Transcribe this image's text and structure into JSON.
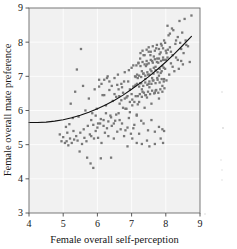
{
  "figure": {
    "background_color": "#ffffff",
    "panel_color": "#f1f1f1",
    "grid_color": "#ffffff",
    "point_color": "#787878",
    "curve_color": "#111111",
    "axis_color": "#6b6b6b"
  },
  "chart_data": {
    "type": "scatter",
    "title": "",
    "xlabel": "Female overall self-perception",
    "ylabel": "Female overall mate preference",
    "xlim": [
      4,
      9
    ],
    "ylim": [
      3,
      9
    ],
    "xticks": [
      4,
      5,
      6,
      7,
      8,
      9
    ],
    "yticks": [
      3,
      4,
      5,
      6,
      7,
      8,
      9
    ],
    "xtick_labels": [
      "4",
      "5",
      "6",
      "7",
      "8",
      "9"
    ],
    "ytick_labels": [
      "3",
      "4",
      "5",
      "6",
      "7",
      "8",
      "9"
    ],
    "grid": true,
    "legend": "none",
    "marker": "square",
    "marker_size_px": 2.3,
    "annotations": [],
    "fit_curve": {
      "label": "quadratic fit",
      "comment": "flat near y=5.65 at low x, rising steeply above x=6.5",
      "x": [
        4.0,
        4.25,
        4.5,
        4.75,
        5.0,
        5.25,
        5.5,
        5.75,
        6.0,
        6.25,
        6.5,
        6.75,
        7.0,
        7.25,
        7.5,
        7.75,
        8.0,
        8.25,
        8.5,
        8.75
      ],
      "y": [
        5.65,
        5.65,
        5.66,
        5.69,
        5.73,
        5.79,
        5.86,
        5.95,
        6.05,
        6.17,
        6.3,
        6.45,
        6.62,
        6.8,
        6.99,
        7.2,
        7.42,
        7.66,
        7.91,
        8.17
      ]
    },
    "points": [
      [
        4.9,
        5.3
      ],
      [
        4.95,
        5.1
      ],
      [
        5.0,
        5.22
      ],
      [
        5.05,
        5.05
      ],
      [
        5.08,
        5.52
      ],
      [
        5.1,
        5.1
      ],
      [
        5.12,
        5.35
      ],
      [
        5.15,
        4.98
      ],
      [
        5.18,
        5.6
      ],
      [
        5.2,
        5.18
      ],
      [
        5.22,
        6.2
      ],
      [
        5.25,
        5.05
      ],
      [
        5.28,
        5.78
      ],
      [
        5.3,
        5.4
      ],
      [
        5.32,
        5.15
      ],
      [
        5.35,
        6.55
      ],
      [
        5.38,
        5.25
      ],
      [
        5.4,
        7.2
      ],
      [
        5.42,
        5.12
      ],
      [
        5.45,
        5.82
      ],
      [
        5.48,
        4.8
      ],
      [
        5.5,
        5.35
      ],
      [
        5.52,
        7.8
      ],
      [
        5.55,
        5.02
      ],
      [
        5.58,
        6.72
      ],
      [
        5.6,
        5.45
      ],
      [
        5.62,
        5.2
      ],
      [
        5.65,
        6.0
      ],
      [
        5.68,
        5.1
      ],
      [
        5.7,
        4.62
      ],
      [
        5.72,
        5.55
      ],
      [
        5.75,
        6.35
      ],
      [
        5.78,
        5.3
      ],
      [
        5.8,
        4.45
      ],
      [
        5.82,
        5.25
      ],
      [
        5.85,
        5.92
      ],
      [
        5.88,
        4.32
      ],
      [
        5.9,
        5.18
      ],
      [
        5.92,
        6.62
      ],
      [
        5.95,
        5.4
      ],
      [
        5.98,
        6.05
      ],
      [
        6.0,
        5.5
      ],
      [
        6.02,
        5.2
      ],
      [
        6.05,
        6.7
      ],
      [
        6.08,
        5.62
      ],
      [
        6.1,
        4.6
      ],
      [
        6.12,
        5.05
      ],
      [
        6.15,
        6.45
      ],
      [
        6.18,
        5.72
      ],
      [
        6.2,
        6.9
      ],
      [
        6.22,
        5.35
      ],
      [
        6.25,
        6.15
      ],
      [
        6.28,
        5.48
      ],
      [
        6.3,
        7.0
      ],
      [
        6.32,
        5.25
      ],
      [
        6.35,
        6.6
      ],
      [
        6.38,
        5.85
      ],
      [
        6.4,
        4.62
      ],
      [
        6.42,
        5.55
      ],
      [
        6.45,
        6.28
      ],
      [
        6.48,
        5.18
      ],
      [
        6.5,
        6.95
      ],
      [
        6.52,
        5.7
      ],
      [
        6.55,
        6.4
      ],
      [
        6.58,
        5.38
      ],
      [
        6.6,
        7.05
      ],
      [
        6.62,
        5.92
      ],
      [
        6.65,
        6.2
      ],
      [
        6.68,
        5.45
      ],
      [
        6.7,
        6.78
      ],
      [
        6.72,
        5.62
      ],
      [
        6.75,
        6.52
      ],
      [
        6.78,
        5.25
      ],
      [
        6.8,
        7.12
      ],
      [
        6.82,
        6.05
      ],
      [
        6.85,
        6.38
      ],
      [
        6.88,
        5.5
      ],
      [
        6.9,
        6.85
      ],
      [
        6.92,
        5.78
      ],
      [
        6.95,
        6.62
      ],
      [
        6.98,
        5.32
      ],
      [
        7.0,
        7.25
      ],
      [
        7.02,
        6.15
      ],
      [
        7.05,
        6.7
      ],
      [
        7.08,
        5.58
      ],
      [
        7.1,
        7.0
      ],
      [
        7.12,
        6.42
      ],
      [
        7.15,
        5.88
      ],
      [
        7.18,
        6.95
      ],
      [
        7.2,
        7.4
      ],
      [
        7.22,
        6.25
      ],
      [
        7.25,
        6.8
      ],
      [
        7.28,
        5.7
      ],
      [
        7.3,
        7.15
      ],
      [
        7.32,
        6.55
      ],
      [
        7.35,
        7.62
      ],
      [
        7.38,
        6.08
      ],
      [
        7.4,
        6.92
      ],
      [
        7.42,
        7.3
      ],
      [
        7.45,
        6.38
      ],
      [
        7.48,
        7.05
      ],
      [
        7.5,
        7.72
      ],
      [
        7.52,
        6.68
      ],
      [
        7.55,
        7.2
      ],
      [
        7.58,
        6.2
      ],
      [
        7.6,
        7.45
      ],
      [
        7.62,
        6.88
      ],
      [
        7.65,
        7.58
      ],
      [
        7.68,
        6.52
      ],
      [
        7.7,
        7.28
      ],
      [
        7.72,
        7.82
      ],
      [
        7.75,
        6.95
      ],
      [
        7.78,
        7.4
      ],
      [
        7.8,
        6.35
      ],
      [
        7.82,
        7.65
      ],
      [
        7.85,
        7.1
      ],
      [
        7.88,
        7.9
      ],
      [
        7.9,
        6.72
      ],
      [
        7.92,
        7.48
      ],
      [
        7.95,
        8.05
      ],
      [
        7.98,
        7.22
      ],
      [
        8.0,
        7.75
      ],
      [
        8.02,
        6.88
      ],
      [
        8.05,
        7.55
      ],
      [
        8.08,
        8.2
      ],
      [
        8.1,
        7.05
      ],
      [
        8.12,
        7.85
      ],
      [
        8.15,
        7.38
      ],
      [
        8.18,
        8.4
      ],
      [
        8.2,
        7.62
      ],
      [
        8.25,
        7.15
      ],
      [
        8.3,
        8.05
      ],
      [
        8.35,
        7.48
      ],
      [
        8.4,
        8.62
      ],
      [
        8.45,
        7.8
      ],
      [
        8.5,
        7.35
      ],
      [
        8.55,
        8.68
      ],
      [
        8.6,
        7.92
      ],
      [
        8.7,
        7.42
      ],
      [
        8.75,
        8.78
      ],
      [
        6.62,
        6.62
      ],
      [
        6.7,
        6.3
      ],
      [
        6.78,
        6.85
      ],
      [
        6.85,
        6.05
      ],
      [
        6.92,
        7.18
      ],
      [
        7.0,
        6.48
      ],
      [
        7.05,
        7.32
      ],
      [
        7.12,
        6.75
      ],
      [
        7.18,
        6.18
      ],
      [
        7.25,
        7.52
      ],
      [
        7.3,
        6.62
      ],
      [
        7.35,
        7.08
      ],
      [
        7.4,
        6.45
      ],
      [
        7.45,
        7.35
      ],
      [
        7.5,
        6.78
      ],
      [
        7.55,
        7.62
      ],
      [
        7.6,
        6.95
      ],
      [
        7.65,
        7.25
      ],
      [
        7.7,
        6.58
      ],
      [
        7.75,
        7.52
      ],
      [
        7.8,
        7.02
      ],
      [
        7.85,
        7.7
      ],
      [
        7.9,
        7.3
      ],
      [
        7.95,
        6.92
      ],
      [
        8.0,
        7.48
      ],
      [
        6.55,
        5.88
      ],
      [
        6.65,
        5.72
      ],
      [
        6.75,
        6.08
      ],
      [
        6.82,
        5.42
      ],
      [
        6.95,
        5.95
      ],
      [
        7.05,
        5.48
      ],
      [
        7.15,
        5.85
      ],
      [
        7.22,
        5.32
      ],
      [
        7.35,
        5.62
      ],
      [
        7.48,
        5.42
      ],
      [
        7.58,
        5.72
      ],
      [
        7.68,
        5.38
      ],
      [
        7.8,
        5.52
      ],
      [
        7.9,
        5.45
      ],
      [
        7.95,
        5.4
      ],
      [
        7.15,
        5.05
      ],
      [
        7.3,
        5.02
      ],
      [
        7.45,
        5.12
      ],
      [
        7.52,
        4.95
      ],
      [
        6.88,
        4.95
      ],
      [
        7.02,
        5.18
      ],
      [
        7.68,
        5.02
      ],
      [
        7.85,
        5.18
      ],
      [
        7.92,
        5.05
      ],
      [
        7.12,
        6.98
      ],
      [
        7.16,
        7.05
      ],
      [
        7.22,
        7.02
      ],
      [
        7.28,
        6.98
      ],
      [
        7.34,
        7.08
      ],
      [
        7.4,
        7.02
      ],
      [
        7.46,
        7.12
      ],
      [
        7.52,
        7.05
      ],
      [
        7.58,
        7.15
      ],
      [
        7.64,
        7.08
      ],
      [
        7.7,
        7.18
      ],
      [
        7.76,
        7.12
      ],
      [
        7.82,
        7.22
      ],
      [
        7.88,
        7.15
      ],
      [
        7.94,
        7.25
      ],
      [
        7.1,
        6.72
      ],
      [
        7.16,
        6.78
      ],
      [
        7.22,
        6.7
      ],
      [
        7.28,
        6.8
      ],
      [
        7.34,
        6.72
      ],
      [
        7.4,
        6.82
      ],
      [
        7.46,
        6.75
      ],
      [
        7.52,
        6.85
      ],
      [
        7.58,
        6.78
      ],
      [
        7.64,
        6.88
      ],
      [
        7.7,
        6.8
      ],
      [
        7.76,
        6.9
      ],
      [
        7.82,
        6.82
      ],
      [
        7.88,
        6.92
      ],
      [
        7.94,
        6.85
      ],
      [
        7.14,
        7.32
      ],
      [
        7.2,
        7.38
      ],
      [
        7.26,
        7.3
      ],
      [
        7.32,
        7.42
      ],
      [
        7.38,
        7.35
      ],
      [
        7.44,
        7.45
      ],
      [
        7.5,
        7.38
      ],
      [
        7.56,
        7.48
      ],
      [
        7.62,
        7.4
      ],
      [
        7.68,
        7.5
      ],
      [
        7.74,
        7.42
      ],
      [
        7.8,
        7.52
      ],
      [
        7.86,
        7.45
      ],
      [
        7.92,
        7.55
      ],
      [
        7.98,
        7.48
      ],
      [
        7.18,
        6.42
      ],
      [
        7.24,
        6.48
      ],
      [
        7.3,
        6.4
      ],
      [
        7.36,
        6.52
      ],
      [
        7.42,
        6.45
      ],
      [
        7.48,
        6.55
      ],
      [
        7.54,
        6.48
      ],
      [
        7.6,
        6.58
      ],
      [
        7.66,
        6.5
      ],
      [
        7.72,
        6.6
      ],
      [
        7.78,
        6.52
      ],
      [
        7.84,
        6.62
      ],
      [
        7.9,
        6.55
      ],
      [
        7.96,
        6.65
      ],
      [
        7.44,
        7.78
      ],
      [
        7.5,
        7.85
      ],
      [
        7.56,
        7.72
      ],
      [
        7.62,
        7.88
      ],
      [
        7.68,
        7.75
      ],
      [
        7.74,
        7.92
      ],
      [
        7.8,
        7.8
      ],
      [
        7.86,
        7.95
      ],
      [
        7.92,
        7.82
      ],
      [
        7.98,
        7.98
      ],
      [
        7.26,
        7.68
      ],
      [
        7.32,
        7.75
      ],
      [
        7.38,
        7.62
      ],
      [
        8.02,
        7.68
      ],
      [
        8.06,
        7.78
      ],
      [
        6.95,
        6.25
      ],
      [
        7.02,
        6.32
      ],
      [
        7.08,
        6.25
      ],
      [
        6.88,
        6.42
      ],
      [
        6.8,
        6.35
      ],
      [
        6.72,
        6.68
      ],
      [
        6.64,
        6.42
      ],
      [
        6.58,
        6.75
      ],
      [
        6.5,
        6.48
      ],
      [
        6.42,
        6.72
      ],
      [
        6.35,
        6.85
      ],
      [
        6.28,
        6.95
      ],
      [
        6.2,
        6.45
      ],
      [
        6.12,
        6.78
      ],
      [
        6.05,
        6.9
      ],
      [
        6.48,
        5.62
      ],
      [
        6.4,
        5.8
      ],
      [
        6.32,
        5.68
      ],
      [
        6.25,
        5.92
      ],
      [
        6.18,
        5.55
      ],
      [
        6.1,
        5.75
      ],
      [
        6.02,
        5.62
      ],
      [
        5.95,
        5.85
      ],
      [
        5.88,
        5.58
      ],
      [
        5.82,
        5.72
      ],
      [
        8.05,
        8.48
      ],
      [
        8.12,
        8.25
      ],
      [
        8.22,
        8.35
      ],
      [
        8.28,
        7.95
      ],
      [
        8.35,
        8.15
      ],
      [
        8.42,
        7.98
      ],
      [
        8.48,
        8.28
      ],
      [
        8.52,
        7.68
      ],
      [
        8.58,
        8.05
      ],
      [
        8.65,
        7.88
      ],
      [
        8.15,
        7.72
      ],
      [
        8.2,
        7.28
      ],
      [
        8.3,
        7.55
      ],
      [
        8.38,
        7.22
      ],
      [
        8.45,
        7.45
      ]
    ]
  }
}
